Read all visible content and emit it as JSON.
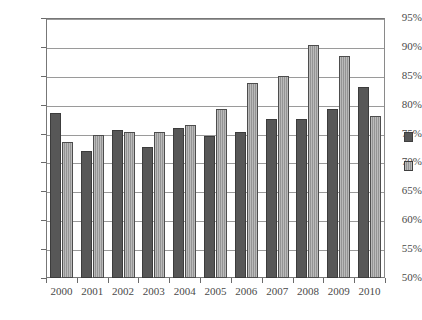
{
  "chart_data": {
    "type": "bar",
    "title": "",
    "subtitle": "",
    "xlabel": "",
    "ylabel": "",
    "categories": [
      "2000",
      "2001",
      "2002",
      "2003",
      "2004",
      "2005",
      "2006",
      "2007",
      "2008",
      "2009",
      "2010"
    ],
    "series": [
      {
        "name": "",
        "color": "#575757",
        "values": [
          78.5,
          72.0,
          75.6,
          72.7,
          76.0,
          74.6,
          75.2,
          77.6,
          77.5,
          79.3,
          83.0
        ]
      },
      {
        "name": "",
        "color": "#9d9d9d",
        "values": [
          73.5,
          74.7,
          75.3,
          75.3,
          76.4,
          79.2,
          83.7,
          85.0,
          90.3,
          88.5,
          78.0
        ]
      }
    ],
    "ylim": [
      50,
      95
    ],
    "ytick_values": [
      50,
      55,
      60,
      65,
      70,
      75,
      80,
      85,
      90,
      95
    ],
    "ytick_labels": [
      "50%",
      "55%",
      "60%",
      "65%",
      "70%",
      "75%",
      "80%",
      "85%",
      "90%",
      "95%"
    ],
    "grid": true,
    "grid_axis": "y",
    "legend_position": "right",
    "legend_entries": [
      {
        "label": "",
        "color": "#575757"
      },
      {
        "label": "",
        "color": "#9d9d9d"
      }
    ],
    "value_suffix": "%"
  }
}
